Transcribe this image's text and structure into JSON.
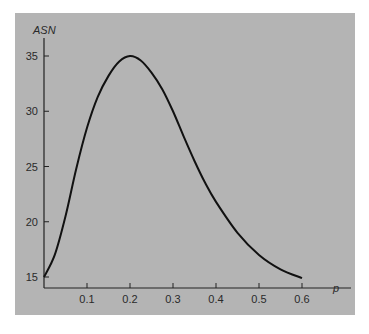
{
  "chart_data": {
    "type": "line",
    "title": "",
    "xlabel": "p",
    "ylabel": "ASN",
    "xlim": [
      0,
      0.65
    ],
    "ylim": [
      14,
      37
    ],
    "xticks": [
      0.1,
      0.2,
      0.3,
      0.4,
      0.5,
      0.6
    ],
    "xtick_labels": [
      "0.1",
      "0.2",
      "0.3",
      "0.4",
      "0.5",
      "0.6"
    ],
    "yticks": [
      15,
      20,
      25,
      30,
      35
    ],
    "ytick_labels": [
      "15",
      "20",
      "25",
      "30",
      "35"
    ],
    "grid": false,
    "legend": null,
    "series": [
      {
        "name": "ASN",
        "x": [
          0.0,
          0.025,
          0.05,
          0.075,
          0.1,
          0.125,
          0.15,
          0.175,
          0.2,
          0.225,
          0.25,
          0.275,
          0.3,
          0.325,
          0.35,
          0.375,
          0.4,
          0.45,
          0.5,
          0.55,
          0.6
        ],
        "y": [
          15.0,
          17.0,
          20.5,
          24.8,
          28.5,
          31.3,
          33.2,
          34.5,
          35.0,
          34.6,
          33.5,
          32.0,
          30.0,
          27.7,
          25.5,
          23.5,
          21.8,
          19.0,
          17.0,
          15.7,
          14.9
        ]
      }
    ],
    "background": "#b4b4b4",
    "line_color": "#111111"
  },
  "caption": {
    "text": "Figure 10.12 ASN curve"
  }
}
